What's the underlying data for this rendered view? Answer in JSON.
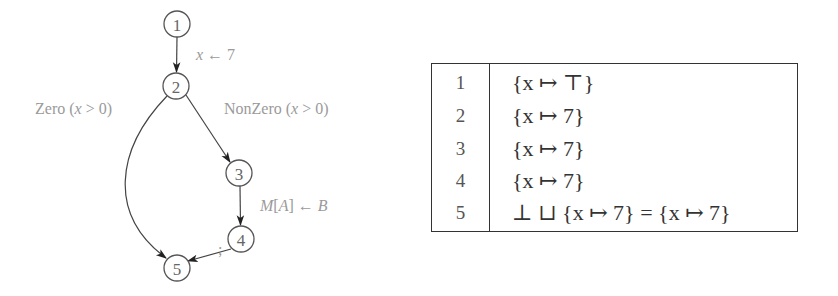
{
  "diagram": {
    "nodes": [
      {
        "id": "1",
        "label": "1",
        "cx": 177,
        "cy": 24
      },
      {
        "id": "2",
        "label": "2",
        "cx": 176,
        "cy": 86
      },
      {
        "id": "3",
        "label": "3",
        "cx": 239,
        "cy": 173
      },
      {
        "id": "4",
        "label": "4",
        "cx": 241,
        "cy": 239
      },
      {
        "id": "5",
        "label": "5",
        "cx": 177,
        "cy": 268
      }
    ],
    "edges": [
      {
        "from": "1",
        "to": "2",
        "label": "x ← 7"
      },
      {
        "from": "2",
        "to": "5",
        "label": "Zero (x > 0)"
      },
      {
        "from": "2",
        "to": "3",
        "label": "NonZero (x > 0)"
      },
      {
        "from": "3",
        "to": "4",
        "label": "M[A] ← B"
      },
      {
        "from": "4",
        "to": "5",
        "label": ";"
      }
    ],
    "edge_labels": {
      "e12_var": "x",
      "e12_op": " ← 7",
      "e25_pre": "Zero (",
      "e25_var": "x",
      "e25_post": " > 0)",
      "e23_pre": "NonZero (",
      "e23_var": "x",
      "e23_post": " > 0)",
      "e34_m": "M",
      "e34_lb": "[",
      "e34_a": "A",
      "e34_rb": "] ← ",
      "e34_b": "B",
      "e45": ";"
    }
  },
  "table": {
    "rows": [
      {
        "node": "1",
        "value": "{x ↦ ⊤}"
      },
      {
        "node": "2",
        "value": "{x ↦ 7}"
      },
      {
        "node": "3",
        "value": "{x ↦ 7}"
      },
      {
        "node": "4",
        "value": "{x ↦ 7}"
      },
      {
        "node": "5",
        "value": "⊥ ⊔ {x ↦ 7} = {x ↦ 7}"
      }
    ]
  }
}
